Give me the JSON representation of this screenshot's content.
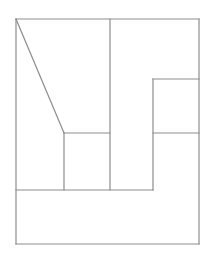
{
  "figure": {
    "title": "",
    "canvas": {
      "width": 213,
      "height": 258,
      "background": "#ffffff"
    },
    "stroke": {
      "color": "#8d8d8d",
      "width": 1.2,
      "linecap": "square"
    },
    "outer_rect": {
      "x": 16,
      "y": 19,
      "width": 183,
      "height": 225
    },
    "segments": [
      {
        "name": "outer-top-edge",
        "x1": 16,
        "y1": 19,
        "x2": 199,
        "y2": 19
      },
      {
        "name": "outer-right-edge",
        "x1": 199,
        "y1": 19,
        "x2": 199,
        "y2": 244
      },
      {
        "name": "outer-bottom-edge",
        "x1": 199,
        "y1": 244,
        "x2": 16,
        "y2": 244
      },
      {
        "name": "outer-left-edge",
        "x1": 16,
        "y1": 244,
        "x2": 16,
        "y2": 19
      },
      {
        "name": "diagonal-hypotenuse",
        "x1": 16,
        "y1": 19,
        "x2": 64,
        "y2": 133
      },
      {
        "name": "tall-vertical-divider",
        "x1": 110,
        "y1": 19,
        "x2": 110,
        "y2": 190
      },
      {
        "name": "inner-left-vertical",
        "x1": 64,
        "y1": 133,
        "x2": 64,
        "y2": 190
      },
      {
        "name": "inner-upper-horizontal",
        "x1": 64,
        "y1": 133,
        "x2": 110,
        "y2": 133
      },
      {
        "name": "mid-long-horizontal",
        "x1": 16,
        "y1": 190,
        "x2": 153,
        "y2": 190
      },
      {
        "name": "right-notch-vertical",
        "x1": 153,
        "y1": 79,
        "x2": 153,
        "y2": 190
      },
      {
        "name": "right-notch-top",
        "x1": 153,
        "y1": 79,
        "x2": 199,
        "y2": 79
      },
      {
        "name": "right-notch-middle",
        "x1": 153,
        "y1": 133,
        "x2": 199,
        "y2": 133
      }
    ]
  }
}
